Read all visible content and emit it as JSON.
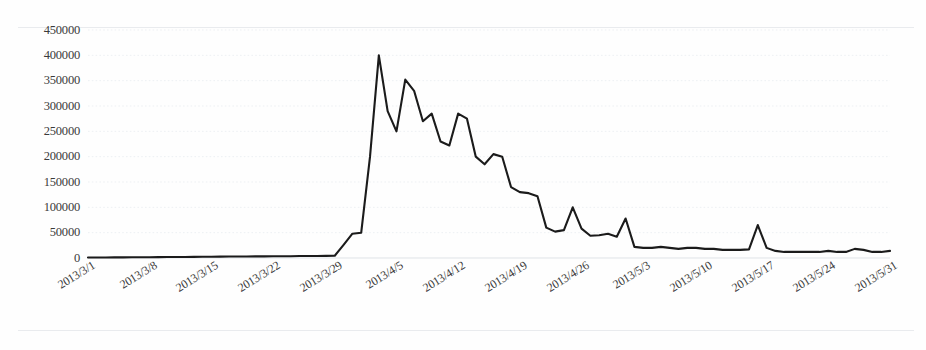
{
  "chart_data": {
    "type": "line",
    "title": "",
    "subtitle": "",
    "xlabel": "",
    "ylabel": "",
    "grid": true,
    "legend": false,
    "legend_position": "none",
    "line_color": "#1b1b1b",
    "background_color": "#fefefe",
    "gridline_color": "#edf0f3",
    "ylim": [
      0,
      450000
    ],
    "ytick_step": 50000,
    "ytick_labels": [
      "450000",
      "400000",
      "350000",
      "300000",
      "250000",
      "200000",
      "150000",
      "100000",
      "50000",
      "0"
    ],
    "ytick_values": [
      450000,
      400000,
      350000,
      300000,
      250000,
      200000,
      150000,
      100000,
      50000,
      0
    ],
    "xtick_labels": [
      "2013/3/1",
      "2013/3/8",
      "2013/3/15",
      "2013/3/22",
      "2013/3/29",
      "2013/4/5",
      "2013/4/12",
      "2013/4/19",
      "2013/4/26",
      "2013/5/3",
      "2013/5/10",
      "2013/5/17",
      "2013/5/24",
      "2013/5/31"
    ],
    "xtick_indices": [
      0,
      7,
      14,
      21,
      28,
      35,
      42,
      49,
      56,
      63,
      70,
      77,
      84,
      91
    ],
    "xlim_labels": [
      "2013/3/1",
      "2013/5/31"
    ],
    "x": [
      "2013/3/1",
      "2013/3/2",
      "2013/3/3",
      "2013/3/4",
      "2013/3/5",
      "2013/3/6",
      "2013/3/7",
      "2013/3/8",
      "2013/3/9",
      "2013/3/10",
      "2013/3/11",
      "2013/3/12",
      "2013/3/13",
      "2013/3/14",
      "2013/3/15",
      "2013/3/16",
      "2013/3/17",
      "2013/3/18",
      "2013/3/19",
      "2013/3/20",
      "2013/3/21",
      "2013/3/22",
      "2013/3/23",
      "2013/3/24",
      "2013/3/25",
      "2013/3/26",
      "2013/3/27",
      "2013/3/28",
      "2013/3/29",
      "2013/3/30",
      "2013/3/31",
      "2013/4/1",
      "2013/4/2",
      "2013/4/3",
      "2013/4/4",
      "2013/4/5",
      "2013/4/6",
      "2013/4/7",
      "2013/4/8",
      "2013/4/9",
      "2013/4/10",
      "2013/4/11",
      "2013/4/12",
      "2013/4/13",
      "2013/4/14",
      "2013/4/15",
      "2013/4/16",
      "2013/4/17",
      "2013/4/18",
      "2013/4/19",
      "2013/4/20",
      "2013/4/21",
      "2013/4/22",
      "2013/4/23",
      "2013/4/24",
      "2013/4/25",
      "2013/4/26",
      "2013/4/27",
      "2013/4/28",
      "2013/4/29",
      "2013/4/30",
      "2013/5/1",
      "2013/5/2",
      "2013/5/3",
      "2013/5/4",
      "2013/5/5",
      "2013/5/6",
      "2013/5/7",
      "2013/5/8",
      "2013/5/9",
      "2013/5/10",
      "2013/5/11",
      "2013/5/12",
      "2013/5/13",
      "2013/5/14",
      "2013/5/15",
      "2013/5/16",
      "2013/5/17",
      "2013/5/18",
      "2013/5/19",
      "2013/5/20",
      "2013/5/21",
      "2013/5/22",
      "2013/5/23",
      "2013/5/24",
      "2013/5/25",
      "2013/5/26",
      "2013/5/27",
      "2013/5/28",
      "2013/5/29",
      "2013/5/30",
      "2013/5/31"
    ],
    "values": [
      1000,
      1000,
      1000,
      1200,
      1200,
      1500,
      1500,
      1500,
      1800,
      2000,
      2000,
      2000,
      2200,
      2500,
      2500,
      2800,
      3000,
      3000,
      3000,
      3200,
      3200,
      3500,
      3500,
      3500,
      3800,
      4000,
      4000,
      4200,
      4500,
      26000,
      48000,
      50000,
      200000,
      400000,
      290000,
      250000,
      352000,
      330000,
      270000,
      285000,
      230000,
      222000,
      285000,
      275000,
      200000,
      185000,
      205000,
      200000,
      140000,
      130000,
      128000,
      122000,
      60000,
      52000,
      55000,
      100000,
      58000,
      44000,
      45000,
      48000,
      42000,
      78000,
      22000,
      20000,
      20000,
      22000,
      20000,
      18000,
      20000,
      20000,
      18000,
      18000,
      16000,
      16000,
      16000,
      17000,
      65000,
      20000,
      14000,
      12000,
      12000,
      12000,
      12000,
      12000,
      14000,
      12000,
      12000,
      18000,
      16000,
      12000,
      12000,
      14000
    ]
  },
  "axes": {
    "y_tick_labels": [
      "450000",
      "400000",
      "350000",
      "300000",
      "250000",
      "200000",
      "150000",
      "100000",
      "50000",
      "0"
    ],
    "x_tick_labels": [
      "2013/3/1",
      "2013/3/8",
      "2013/3/15",
      "2013/3/22",
      "2013/3/29",
      "2013/4/5",
      "2013/4/12",
      "2013/4/19",
      "2013/4/26",
      "2013/5/3",
      "2013/5/10",
      "2013/5/17",
      "2013/5/24",
      "2013/5/31"
    ]
  }
}
